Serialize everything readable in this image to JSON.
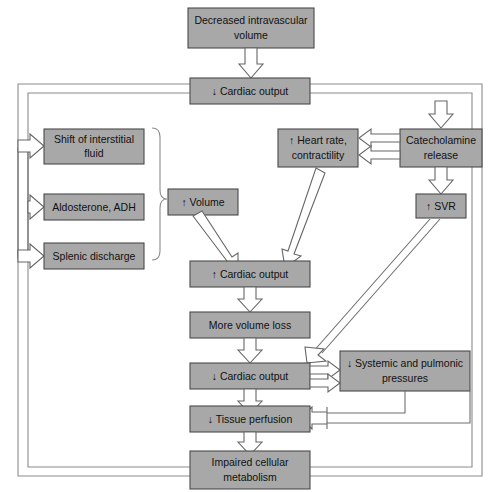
{
  "diagram": {
    "canvas": {
      "width": 496,
      "height": 492
    },
    "style": {
      "box_fill": "#a8a8a8",
      "box_stroke": "#4a4a4a",
      "arrow_fill": "#ffffff",
      "arrow_stroke": "#666666",
      "line_color": "#6e6e6e",
      "text_color": "#111111",
      "background": "#ffffff"
    },
    "nodes": [
      {
        "id": "decreased-volume",
        "line1": "Decreased intravascular",
        "line2": "volume"
      },
      {
        "id": "cardiac-output-down-1",
        "line1": "↓ Cardiac output",
        "line2": ""
      },
      {
        "id": "shift-interstitial",
        "line1": "Shift of interstitial",
        "line2": "fluid"
      },
      {
        "id": "aldosterone-adh",
        "line1": "Aldosterone, ADH",
        "line2": ""
      },
      {
        "id": "splenic-discharge",
        "line1": "Splenic discharge",
        "line2": ""
      },
      {
        "id": "volume-up",
        "line1": "↑ Volume",
        "line2": ""
      },
      {
        "id": "heart-rate",
        "line1": "↑ Heart rate,",
        "line2": "contractility"
      },
      {
        "id": "catecholamine",
        "line1": "Catecholamine",
        "line2": "release"
      },
      {
        "id": "svr-up",
        "line1": "↑ SVR",
        "line2": ""
      },
      {
        "id": "cardiac-output-up",
        "line1": "↑ Cardiac output",
        "line2": ""
      },
      {
        "id": "more-volume-loss",
        "line1": "More volume loss",
        "line2": ""
      },
      {
        "id": "cardiac-output-down-2",
        "line1": "↓ Cardiac output",
        "line2": ""
      },
      {
        "id": "systemic-pressures",
        "line1": "↓ Systemic and pulmonic",
        "line2": "pressures"
      },
      {
        "id": "tissue-perfusion",
        "line1": "↓ Tissue perfusion",
        "line2": ""
      },
      {
        "id": "impaired-metabolism",
        "line1": "Impaired cellular",
        "line2": "metabolism"
      }
    ]
  }
}
